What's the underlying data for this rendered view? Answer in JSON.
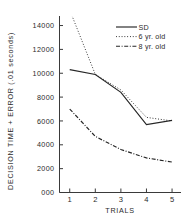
{
  "chart_data": {
    "type": "line",
    "title": "",
    "xlabel": "TRIALS",
    "ylabel": "DECISION TIME + ERROR (.01 seconds)",
    "x": [
      1,
      2,
      3,
      4,
      5
    ],
    "categories": [
      "1",
      "2",
      "3",
      "4",
      "5"
    ],
    "xtick_labels": [
      "1",
      "2",
      "3",
      "4",
      "5"
    ],
    "ytick_labels": [
      "000",
      "2000",
      "4000",
      "6000",
      "8000",
      "10000",
      "12000",
      "14000"
    ],
    "ytick_values": [
      0,
      2000,
      4000,
      6000,
      8000,
      10000,
      12000,
      14000
    ],
    "xlim": [
      0.6,
      5.35
    ],
    "ylim": [
      0,
      14800
    ],
    "grid": false,
    "legend_position": "top-right",
    "series": [
      {
        "name": "SD",
        "style": "solid",
        "color": "#262626",
        "values": [
          10300,
          9900,
          8400,
          5700,
          6050
        ]
      },
      {
        "name": "6 yr. old",
        "style": "dotted",
        "color": "#262626",
        "values": [
          15300,
          9900,
          8600,
          6300,
          6000
        ]
      },
      {
        "name": "8 yr. old",
        "style": "dashdot",
        "color": "#262626",
        "values": [
          7000,
          4700,
          3600,
          2900,
          2550
        ]
      }
    ]
  },
  "legend": {
    "entries": [
      {
        "label": "SD",
        "style": "solid"
      },
      {
        "label": "6 yr. old",
        "style": "dotted"
      },
      {
        "label": "8 yr. old",
        "style": "dashdot"
      }
    ]
  }
}
